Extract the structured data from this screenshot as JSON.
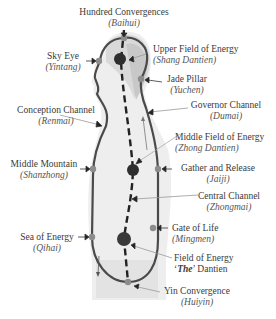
{
  "diagram": {
    "type": "energy-channel-anatomy",
    "labels": [
      {
        "id": "baihui",
        "en": "Hundred Convergences",
        "cn": "Baihui"
      },
      {
        "id": "yintang",
        "en": "Sky Eye",
        "cn": "Yintang"
      },
      {
        "id": "shang",
        "en": "Upper Field of Energy",
        "cn": "Shang Dantien"
      },
      {
        "id": "yuchen",
        "en": "Jade Pillar",
        "cn": "Yuchen"
      },
      {
        "id": "renmai",
        "en": "Conception Channel",
        "cn": "Renmai"
      },
      {
        "id": "dumai",
        "en": "Governor Channel",
        "cn": "Dumai"
      },
      {
        "id": "zhong",
        "en": "Middle Field of Energy",
        "cn": "Zhong Dantien"
      },
      {
        "id": "shanzhong",
        "en": "Middle Mountain",
        "cn": "Shanzhong"
      },
      {
        "id": "jaiji",
        "en": "Gather and Release",
        "cn": "Jaiji"
      },
      {
        "id": "zhongmai",
        "en": "Central Channel",
        "cn": "Zhongmai"
      },
      {
        "id": "mingmen",
        "en": "Gate of Life",
        "cn": "Mingmen"
      },
      {
        "id": "qihai",
        "en": "Sea of Energy",
        "cn": "Qihai"
      },
      {
        "id": "dantien",
        "en_pre": "Field of Energy",
        "en_q1": "‘",
        "en_bold": "The",
        "en_q2": "’ Dantien"
      },
      {
        "id": "huiyin",
        "en": "Yin Convergence",
        "cn": "Huiyin"
      }
    ],
    "colors": {
      "channel": "#4a4a4a",
      "point": "#8c8c8c",
      "dantien": "#2e2e2e",
      "silhouette": "#e6e6e6",
      "head_shade": "#cfcfcf",
      "leader": "#9a9a9a"
    }
  }
}
